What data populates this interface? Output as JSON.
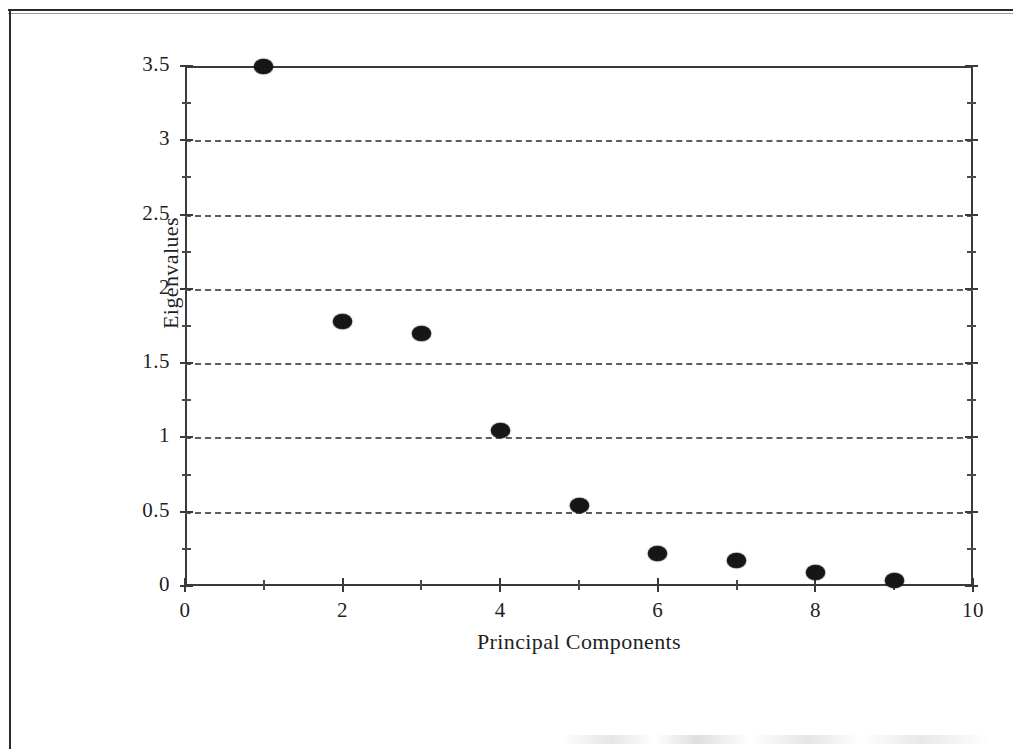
{
  "figure": {
    "kind": "scree-plot",
    "ink_color": "#161616",
    "axis_color": "#3a3a3a",
    "grid_color": "#5d5d5d"
  },
  "chart_data": {
    "type": "scatter",
    "title": "",
    "xlabel": "Principal Components",
    "ylabel": "Eigenvalues",
    "x": [
      1,
      2,
      3,
      4,
      5,
      6,
      7,
      8,
      9
    ],
    "values": [
      3.5,
      1.78,
      1.7,
      1.05,
      0.54,
      0.22,
      0.17,
      0.09,
      0.04
    ],
    "series": [
      {
        "name": "Eigenvalues",
        "x": [
          1,
          2,
          3,
          4,
          5,
          6,
          7,
          8,
          9
        ],
        "values": [
          3.5,
          1.78,
          1.7,
          1.05,
          0.54,
          0.22,
          0.17,
          0.09,
          0.04
        ]
      }
    ],
    "xlim": [
      0,
      10
    ],
    "ylim": [
      0,
      3.5
    ],
    "xticks": [
      0,
      2,
      4,
      6,
      8,
      10
    ],
    "xtick_labels": [
      "0",
      "2",
      "4",
      "6",
      "8",
      "10"
    ],
    "x_minor_ticks": [
      1,
      3,
      5,
      7,
      9
    ],
    "yticks": [
      0,
      0.5,
      1,
      1.5,
      2,
      2.5,
      3,
      3.5
    ],
    "ytick_labels": [
      "0",
      "0.5",
      "1",
      "1.5",
      "2",
      "2.5",
      "3",
      "3.5"
    ],
    "y_minor_ticks": [
      0.25,
      0.75,
      1.25,
      1.75,
      2.25,
      2.75,
      3.25
    ],
    "grid": "horizontal-dashed",
    "gridline_values": [
      0.5,
      1,
      1.5,
      2,
      2.5,
      3
    ],
    "legend": "none",
    "marker": "filled-ellipse"
  }
}
